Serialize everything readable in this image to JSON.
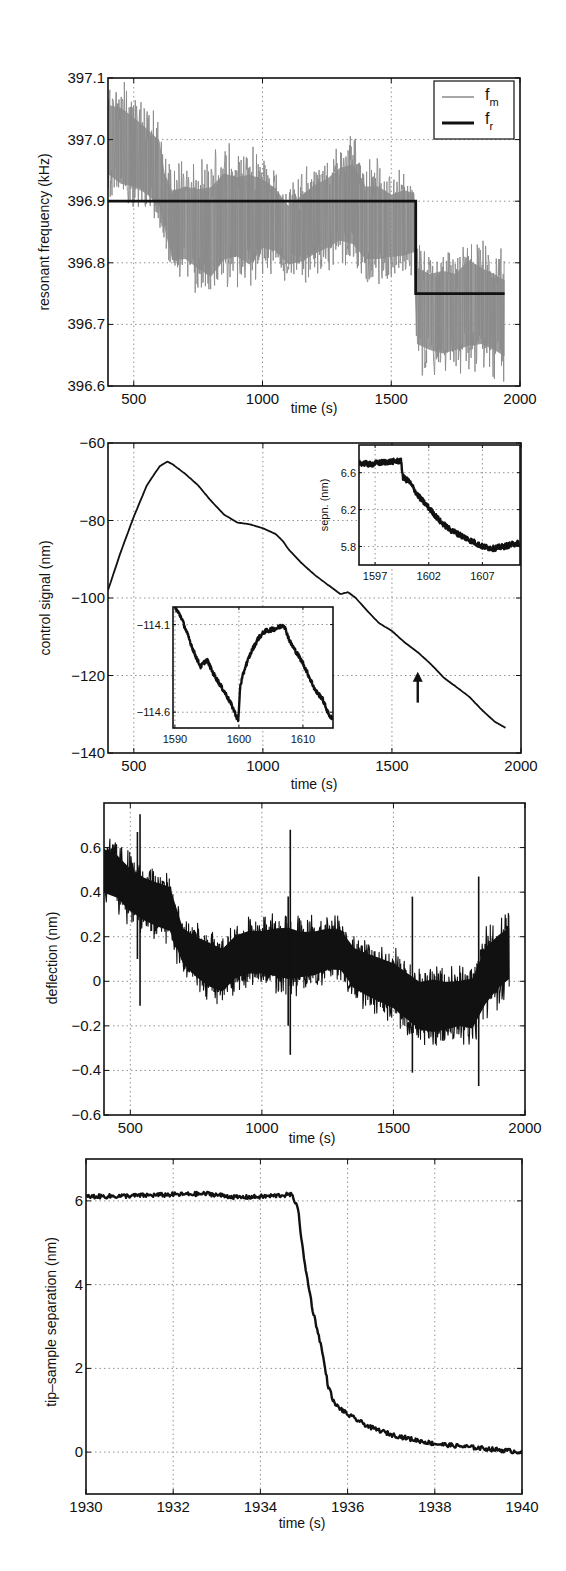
{
  "figure": {
    "panel_count": 4,
    "colors": {
      "trace_dark": "#111111",
      "trace_gray": "#8a8a8a",
      "grid": "#777777",
      "background": "#ffffff"
    }
  },
  "chart_data": [
    {
      "id": "p1",
      "type": "line",
      "title": "",
      "xlabel": "time (s)",
      "ylabel": "resonant frequency (kHz)",
      "xlim": [
        400,
        2000
      ],
      "ylim": [
        396.6,
        397.1
      ],
      "xticks": [
        500,
        1000,
        1500,
        2000
      ],
      "xtick_labels": [
        "500",
        "1000",
        "1500",
        "2000"
      ],
      "yticks": [
        396.6,
        396.7,
        396.8,
        396.9,
        397.0,
        397.1
      ],
      "ytick_labels": [
        "396.6",
        "396.7",
        "396.8",
        "396.9",
        "397.0",
        "397.1"
      ],
      "grid": true,
      "legend": {
        "position": "upper right",
        "entries": [
          {
            "label": "f",
            "sub": "m",
            "style": "thin gray"
          },
          {
            "label": "f",
            "sub": "r",
            "style": "thick black"
          }
        ]
      },
      "series": [
        {
          "name": "f_m",
          "style": "noisy-band",
          "color": "#8a8a8a",
          "x": [
            400,
            450,
            500,
            550,
            600,
            620,
            650,
            700,
            750,
            800,
            850,
            900,
            950,
            1000,
            1050,
            1100,
            1150,
            1200,
            1250,
            1300,
            1350,
            1400,
            1450,
            1500,
            1550,
            1590,
            1600,
            1650,
            1700,
            1750,
            1800,
            1850,
            1900,
            1940
          ],
          "upper": [
            397.1,
            397.1,
            397.08,
            397.06,
            397.04,
            396.98,
            396.96,
            396.97,
            396.97,
            396.98,
            397.0,
            396.99,
            397.0,
            396.98,
            396.96,
            396.93,
            396.95,
            396.97,
            396.98,
            397.0,
            397.01,
            396.97,
            396.97,
            396.95,
            396.96,
            396.95,
            396.84,
            396.83,
            396.84,
            396.83,
            396.86,
            396.84,
            396.83,
            396.82
          ],
          "lower": [
            396.9,
            396.88,
            396.88,
            396.87,
            396.85,
            396.82,
            396.76,
            396.76,
            396.74,
            396.72,
            396.75,
            396.76,
            396.74,
            396.78,
            396.78,
            396.76,
            396.76,
            396.77,
            396.78,
            396.79,
            396.78,
            396.76,
            396.76,
            396.77,
            396.77,
            396.78,
            396.62,
            396.61,
            396.6,
            396.61,
            396.61,
            396.62,
            396.61,
            396.6
          ]
        },
        {
          "name": "f_r",
          "style": "step",
          "color": "#111111",
          "x": [
            400,
            1595,
            1595,
            1940
          ],
          "y": [
            396.9,
            396.9,
            396.75,
            396.75
          ]
        }
      ]
    },
    {
      "id": "p2",
      "type": "line",
      "title": "",
      "xlabel": "time (s)",
      "ylabel": "control signal (nm)",
      "xlim": [
        400,
        2000
      ],
      "ylim": [
        -140,
        -60
      ],
      "xticks": [
        500,
        1000,
        1500,
        2000
      ],
      "xtick_labels": [
        "500",
        "1000",
        "1500",
        "2000"
      ],
      "yticks": [
        -140,
        -120,
        -100,
        -80,
        -60
      ],
      "ytick_labels": [
        "−140",
        "−120",
        "−100",
        "−80",
        "−60"
      ],
      "grid": true,
      "series": [
        {
          "name": "control signal",
          "color": "#111111",
          "x": [
            400,
            450,
            500,
            550,
            600,
            630,
            650,
            700,
            750,
            800,
            850,
            900,
            950,
            1000,
            1050,
            1080,
            1100,
            1150,
            1200,
            1250,
            1280,
            1300,
            1330,
            1360,
            1400,
            1450,
            1500,
            1550,
            1600,
            1650,
            1700,
            1750,
            1800,
            1850,
            1900,
            1940
          ],
          "y": [
            -98,
            -88,
            -79,
            -71,
            -66,
            -64.8,
            -65.5,
            -68,
            -71,
            -75,
            -78.5,
            -80.5,
            -81,
            -82,
            -83.5,
            -85.5,
            -87.5,
            -91,
            -94,
            -96.5,
            -98,
            -99,
            -98.5,
            -100,
            -103,
            -106.5,
            -108.5,
            -111.5,
            -114,
            -117,
            -120.5,
            -123,
            -125.5,
            -129,
            -132,
            -133.5
          ]
        }
      ],
      "annotations": [
        {
          "type": "arrow",
          "x": 1600,
          "y_tail": -127,
          "y_head": -119,
          "label": ""
        }
      ],
      "insets": [
        {
          "id": "p2-inset-upper-right",
          "ylabel": "sepn. (nm)",
          "xlabel": "",
          "xlim": [
            1595.5,
            1610.5
          ],
          "ylim": [
            5.6,
            6.9
          ],
          "xticks": [
            1597,
            1602,
            1607
          ],
          "xtick_labels": [
            "1597",
            "1602",
            "1607"
          ],
          "yticks": [
            5.8,
            6.2,
            6.6
          ],
          "ytick_labels": [
            "5.8",
            "6.2",
            "6.6"
          ],
          "grid": true,
          "series": [
            {
              "name": "separation",
              "color": "#111111",
              "x": [
                1595.5,
                1596.5,
                1597.5,
                1598.5,
                1599.4,
                1599.6,
                1600.2,
                1601,
                1602,
                1603,
                1604,
                1605,
                1606,
                1607,
                1608,
                1609,
                1610.4
              ],
              "y": [
                6.71,
                6.69,
                6.71,
                6.72,
                6.73,
                6.55,
                6.5,
                6.35,
                6.22,
                6.08,
                5.98,
                5.92,
                5.86,
                5.8,
                5.78,
                5.8,
                5.84
              ],
              "noise": 0.03
            }
          ]
        },
        {
          "id": "p2-inset-lower-left",
          "ylabel": "",
          "xlabel": "",
          "xlim": [
            1589.7,
            1614.7
          ],
          "ylim": [
            -114.69,
            -114.0
          ],
          "xticks": [
            1590,
            1600,
            1610
          ],
          "xtick_labels": [
            "1590",
            "1600",
            "1610"
          ],
          "yticks": [
            -114.6,
            -114.1
          ],
          "ytick_labels": [
            "−114.6",
            "−114.1"
          ],
          "grid": true,
          "series": [
            {
              "name": "control signal (zoom)",
              "color": "#111111",
              "x": [
                1590,
                1591,
                1592,
                1593,
                1594,
                1595,
                1596,
                1597,
                1598,
                1599,
                1599.9,
                1600.2,
                1601,
                1602,
                1603,
                1604,
                1605,
                1606,
                1607,
                1608,
                1609,
                1610,
                1611,
                1612,
                1613,
                1614,
                1614.6
              ],
              "y": [
                -114.0,
                -114.06,
                -114.16,
                -114.26,
                -114.34,
                -114.3,
                -114.38,
                -114.44,
                -114.5,
                -114.57,
                -114.65,
                -114.45,
                -114.34,
                -114.25,
                -114.18,
                -114.14,
                -114.13,
                -114.12,
                -114.1,
                -114.2,
                -114.26,
                -114.32,
                -114.4,
                -114.48,
                -114.52,
                -114.61,
                -114.64
              ],
              "noise": 0.012
            }
          ]
        }
      ]
    },
    {
      "id": "p3",
      "type": "line",
      "title": "",
      "xlabel": "time (s)",
      "ylabel": "deflection (nm)",
      "xlim": [
        400,
        2000
      ],
      "ylim": [
        -0.6,
        0.8
      ],
      "xticks": [
        500,
        1000,
        1500,
        2000
      ],
      "xtick_labels": [
        "500",
        "1000",
        "1500",
        "2000"
      ],
      "yticks": [
        -0.6,
        -0.4,
        -0.2,
        0,
        0.2,
        0.4,
        0.6
      ],
      "ytick_labels": [
        "−0.6",
        "−0.4",
        "−0.2",
        "0",
        "0.2",
        "0.4",
        "0.6"
      ],
      "grid": true,
      "series": [
        {
          "name": "deflection",
          "style": "noisy-band",
          "color": "#111111",
          "x": [
            400,
            450,
            500,
            550,
            600,
            650,
            700,
            750,
            800,
            850,
            900,
            950,
            1000,
            1050,
            1100,
            1150,
            1200,
            1250,
            1300,
            1350,
            1400,
            1450,
            1500,
            1550,
            1600,
            1650,
            1700,
            1750,
            1800,
            1850,
            1900,
            1940
          ],
          "upper": [
            0.67,
            0.64,
            0.58,
            0.54,
            0.52,
            0.5,
            0.3,
            0.27,
            0.25,
            0.22,
            0.28,
            0.3,
            0.3,
            0.32,
            0.33,
            0.3,
            0.3,
            0.31,
            0.3,
            0.22,
            0.2,
            0.18,
            0.16,
            0.12,
            0.08,
            0.1,
            0.08,
            0.08,
            0.1,
            0.25,
            0.3,
            0.33
          ],
          "lower": [
            0.32,
            0.3,
            0.24,
            0.2,
            0.17,
            0.15,
            0.02,
            -0.05,
            -0.1,
            -0.12,
            -0.06,
            -0.04,
            -0.04,
            -0.06,
            -0.08,
            -0.06,
            -0.05,
            -0.02,
            -0.02,
            -0.1,
            -0.14,
            -0.17,
            -0.2,
            -0.25,
            -0.3,
            -0.32,
            -0.3,
            -0.28,
            -0.3,
            -0.2,
            -0.12,
            -0.08
          ],
          "spikes": [
            {
              "x": 527,
              "y_top": 0.67,
              "y_bottom": 0.1
            },
            {
              "x": 537,
              "y_top": 0.75,
              "y_bottom": -0.11
            },
            {
              "x": 1100,
              "y_top": 0.38,
              "y_bottom": -0.2
            },
            {
              "x": 1108,
              "y_top": 0.68,
              "y_bottom": -0.33
            },
            {
              "x": 1572,
              "y_top": 0.38,
              "y_bottom": -0.41
            },
            {
              "x": 1824,
              "y_top": 0.47,
              "y_bottom": -0.47
            }
          ]
        }
      ]
    },
    {
      "id": "p4",
      "type": "line",
      "title": "",
      "xlabel": "time (s)",
      "ylabel": "tip–sample separation (nm)",
      "xlim": [
        1930,
        1940
      ],
      "ylim": [
        -1,
        7
      ],
      "xticks": [
        1930,
        1932,
        1934,
        1936,
        1938,
        1940
      ],
      "xtick_labels": [
        "1930",
        "1932",
        "1934",
        "1936",
        "1938",
        "1940"
      ],
      "yticks": [
        0,
        2,
        4,
        6
      ],
      "ytick_labels": [
        "0",
        "2",
        "4",
        "6"
      ],
      "grid": true,
      "series": [
        {
          "name": "tip-sample separation",
          "color": "#111111",
          "x": [
            1930,
            1931,
            1932,
            1932.8,
            1933.5,
            1934,
            1934.7,
            1934.85,
            1935,
            1935.2,
            1935.4,
            1935.55,
            1935.7,
            1936,
            1936.5,
            1937,
            1937.5,
            1938,
            1938.5,
            1939,
            1939.5,
            1940
          ],
          "y": [
            6.1,
            6.12,
            6.15,
            6.17,
            6.08,
            6.1,
            6.15,
            5.9,
            4.6,
            3.4,
            2.5,
            1.6,
            1.15,
            0.9,
            0.6,
            0.42,
            0.3,
            0.2,
            0.15,
            0.1,
            0.05,
            0.0
          ],
          "noise": 0.05
        }
      ]
    }
  ]
}
